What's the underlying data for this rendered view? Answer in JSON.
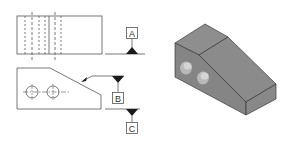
{
  "figure": {
    "colors": {
      "line": "#555555",
      "datum_triangle": "#1a1a1a",
      "block_top": "#8e8e8e",
      "block_slope": "#8a8a8a",
      "block_side": "#909090",
      "block_front": "#7d7d7d",
      "block_edge": "#3a3a3a"
    }
  },
  "datums": [
    {
      "id": "A",
      "label": "A"
    },
    {
      "id": "B",
      "label": "B"
    },
    {
      "id": "C",
      "label": "C"
    }
  ],
  "views": {
    "top_view": {
      "name": "top view"
    },
    "front_view": {
      "name": "front view",
      "holes": 2
    },
    "isometric_view": {
      "name": "isometric view",
      "holes": 2
    }
  }
}
